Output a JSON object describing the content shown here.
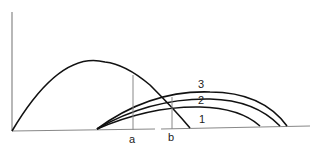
{
  "diagram": {
    "labels": {
      "a": "a",
      "b": "b",
      "curve1": "1",
      "curve2": "2",
      "curve3": "3"
    },
    "colors": {
      "curve": "#111111",
      "axis": "#888888"
    }
  }
}
